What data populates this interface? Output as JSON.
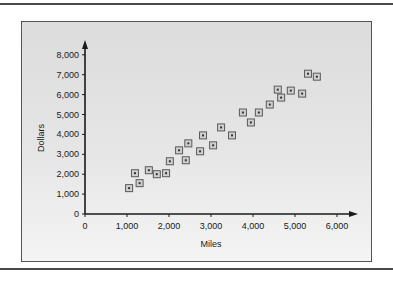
{
  "chart_data": {
    "type": "scatter",
    "title": "",
    "xlabel": "Miles",
    "ylabel": "Dollars",
    "xlim": [
      0,
      6000
    ],
    "ylim": [
      0,
      8000
    ],
    "x_ticks": [
      0,
      1000,
      2000,
      3000,
      4000,
      5000,
      6000
    ],
    "x_tick_labels": [
      "0",
      "1,000",
      "2,000",
      "3,000",
      "4,000",
      "5,000",
      "6,000"
    ],
    "y_ticks": [
      0,
      1000,
      2000,
      3000,
      4000,
      5000,
      6000,
      7000,
      8000
    ],
    "y_tick_labels": [
      "0",
      "1,000",
      "2,000",
      "3,000",
      "4,000",
      "5,000",
      "6,000",
      "7,000",
      "8,000"
    ],
    "grid": false,
    "legend": null,
    "marker": "square-with-dot",
    "series": [
      {
        "name": "Miles vs Dollars",
        "points": [
          {
            "x": 1050,
            "y": 1300
          },
          {
            "x": 1190,
            "y": 2050
          },
          {
            "x": 1300,
            "y": 1550
          },
          {
            "x": 1520,
            "y": 2200
          },
          {
            "x": 1710,
            "y": 2000
          },
          {
            "x": 1930,
            "y": 2050
          },
          {
            "x": 2020,
            "y": 2650
          },
          {
            "x": 2240,
            "y": 3200
          },
          {
            "x": 2400,
            "y": 2700
          },
          {
            "x": 2460,
            "y": 3550
          },
          {
            "x": 2740,
            "y": 3150
          },
          {
            "x": 2810,
            "y": 3950
          },
          {
            "x": 3050,
            "y": 3450
          },
          {
            "x": 3240,
            "y": 4350
          },
          {
            "x": 3500,
            "y": 3950
          },
          {
            "x": 3760,
            "y": 5100
          },
          {
            "x": 3950,
            "y": 4600
          },
          {
            "x": 4140,
            "y": 5100
          },
          {
            "x": 4400,
            "y": 5500
          },
          {
            "x": 4590,
            "y": 6250
          },
          {
            "x": 4670,
            "y": 5850
          },
          {
            "x": 4900,
            "y": 6200
          },
          {
            "x": 5170,
            "y": 6050
          },
          {
            "x": 5310,
            "y": 7050
          },
          {
            "x": 5520,
            "y": 6900
          }
        ]
      }
    ]
  },
  "colors": {
    "marker_stroke": "#5a5a5a",
    "marker_fill": "#d0d0d0",
    "axis": "#1a1a1a",
    "frame_border": "#555555"
  }
}
